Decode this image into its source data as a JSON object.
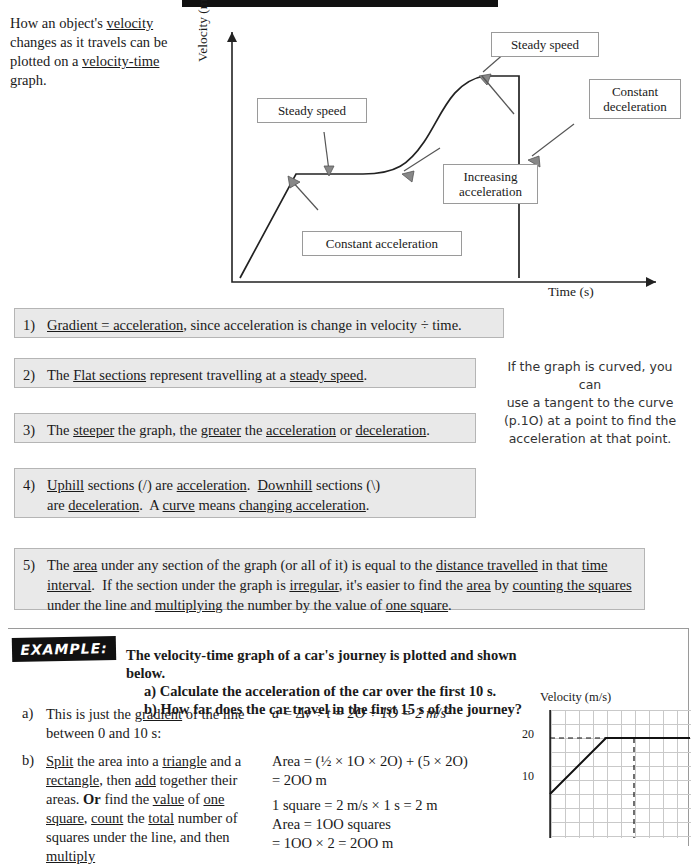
{
  "intro": {
    "line1": "How an object's ",
    "u1": "velocity",
    "line2": " changes as it travels can be plotted on a ",
    "u2": "velocity-time",
    "line3": " graph."
  },
  "graph": {
    "ylabel": "Velocity (m/s)",
    "xlabel": "Time (s)",
    "callouts": [
      {
        "id": "steady-speed-1",
        "text": "Steady speed"
      },
      {
        "id": "steady-speed-2",
        "text": "Steady speed"
      },
      {
        "id": "constant-deceleration",
        "text": "Constant\ndeceleration"
      },
      {
        "id": "increasing-acceleration",
        "text": "Increasing\nacceleration"
      },
      {
        "id": "constant-acceleration",
        "text": "Constant acceleration"
      }
    ]
  },
  "notes": [
    {
      "num": "1)",
      "parts": [
        {
          "t": "Gradient = acceleration",
          "u": true
        },
        {
          "t": ", since acceleration is change in velocity ÷ time.",
          "u": false
        }
      ]
    },
    {
      "num": "2)",
      "parts": [
        {
          "t": "Flat sections",
          "u": true
        },
        {
          "t": " represent travelling at a ",
          "u": false
        },
        {
          "t": "steady speed",
          "u": true
        },
        {
          "t": ".",
          "u": false
        }
      ]
    },
    {
      "num": "3)",
      "parts": [
        {
          "t": "The ",
          "u": false
        },
        {
          "t": "steeper",
          "u": true
        },
        {
          "t": " the graph, the ",
          "u": false
        },
        {
          "t": "greater",
          "u": true
        },
        {
          "t": " the ",
          "u": false
        },
        {
          "t": "acceleration",
          "u": true
        },
        {
          "t": " or ",
          "u": false
        },
        {
          "t": "deceleration",
          "u": true
        },
        {
          "t": ".",
          "u": false
        }
      ]
    },
    {
      "num": "4)",
      "parts": [
        {
          "t": "Uphill",
          "u": true
        },
        {
          "t": " sections (/) are ",
          "u": false
        },
        {
          "t": "acceleration",
          "u": true
        },
        {
          "t": ".  ",
          "u": false
        },
        {
          "t": "Downhill",
          "u": true
        },
        {
          "t": " sections (\\) are ",
          "u": false
        },
        {
          "t": "deceleration",
          "u": true
        },
        {
          "t": ".  A ",
          "u": false
        },
        {
          "t": "curve",
          "u": true
        },
        {
          "t": " means ",
          "u": false
        },
        {
          "t": "changing acceleration",
          "u": true
        },
        {
          "t": ".",
          "u": false
        }
      ]
    },
    {
      "num": "5)",
      "parts": [
        {
          "t": "The ",
          "u": false
        },
        {
          "t": "area",
          "u": true
        },
        {
          "t": " under any section of the graph (or all of it) is equal to the ",
          "u": false
        },
        {
          "t": "distance travelled",
          "u": true
        },
        {
          "t": " in that ",
          "u": false
        },
        {
          "t": "time interval",
          "u": true
        },
        {
          "t": ".  If the section under the graph is ",
          "u": false
        },
        {
          "t": "irregular",
          "u": true
        },
        {
          "t": ", it's easier to find the ",
          "u": false
        },
        {
          "t": "area",
          "u": true
        },
        {
          "t": " by ",
          "u": false
        },
        {
          "t": "counting the squares",
          "u": true
        },
        {
          "t": " under the line and ",
          "u": false
        },
        {
          "t": "multiplying",
          "u": true
        },
        {
          "t": " the number by the value of ",
          "u": false
        },
        {
          "t": "one square",
          "u": true
        },
        {
          "t": ".",
          "u": false
        }
      ]
    }
  ],
  "sidenote": {
    "line1": "If the graph is curved, you can",
    "line2": "use a tangent to the curve",
    "line3": "(p.1O) at a point to find the",
    "line4": "acceleration at that point."
  },
  "example": {
    "tag": "EXAMPLE:",
    "heading": "The velocity-time graph of a car's journey is plotted and shown below.",
    "sub_a": "a)   Calculate the acceleration of the car over the first 10 s.",
    "sub_b": "b)   How far does the car travel in the first 15 s of the journey?",
    "a_marker": "a)",
    "a_parts": [
      {
        "t": "This is just the ",
        "u": false
      },
      {
        "t": "gradient",
        "u": true
      },
      {
        "t": " of the line between 0 and 10 s:",
        "u": false
      }
    ],
    "a_math": "a = Δv ÷ t = 2O ÷ 1O = 2 m/s²",
    "b_marker": "b)",
    "b_parts": [
      {
        "t": "Split",
        "u": true
      },
      {
        "t": " the area into a ",
        "u": false
      },
      {
        "t": "triangle",
        "u": true
      },
      {
        "t": " and a ",
        "u": false
      },
      {
        "t": "rectangle",
        "u": true
      },
      {
        "t": ", then ",
        "u": false
      },
      {
        "t": "add",
        "u": true
      },
      {
        "t": " together their areas.  ",
        "u": false
      },
      {
        "t": "Or",
        "u": false,
        "b": true
      },
      {
        "t": " find the ",
        "u": false
      },
      {
        "t": "value",
        "u": true
      },
      {
        "t": " of ",
        "u": false
      },
      {
        "t": "one square",
        "u": true
      },
      {
        "t": ", ",
        "u": false
      },
      {
        "t": "count",
        "u": true
      },
      {
        "t": " the ",
        "u": false
      },
      {
        "t": "total",
        "u": true
      },
      {
        "t": " number of squares under the line, and then ",
        "u": false
      },
      {
        "t": "multiply",
        "u": true
      },
      {
        "t": "",
        "u": false
      }
    ],
    "b_math": [
      "Area = (½ × 1O × 2O) + (5 × 2O)",
      "        = 2OO m",
      "1 square = 2 m/s × 1 s = 2 m",
      "Area = 1OO squares",
      "        = 1OO × 2 = 2OO m"
    ]
  },
  "minigraph": {
    "title": "Velocity (m/s)",
    "ticks": [
      "20",
      "10"
    ]
  }
}
